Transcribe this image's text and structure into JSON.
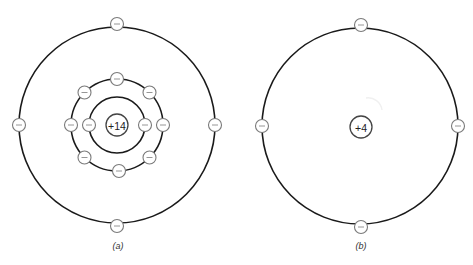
{
  "figure": {
    "atom_a": {
      "nucleus_label": "+14",
      "caption": "(a)",
      "center": [
        117,
        125
      ],
      "shells": [
        {
          "radius": 28,
          "electron_count": 2
        },
        {
          "radius": 46,
          "electron_count": 8
        },
        {
          "radius": 98,
          "electron_count": 4
        }
      ],
      "electron_symbol": "−"
    },
    "atom_b": {
      "nucleus_label": "+4",
      "caption": "(b)",
      "center": [
        360,
        126
      ],
      "shells": [
        {
          "radius": 98,
          "electron_count": 4
        }
      ],
      "electron_symbol": "−"
    }
  }
}
